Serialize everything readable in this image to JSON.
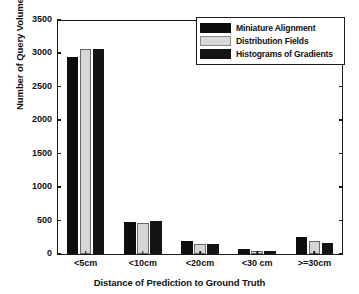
{
  "chart_data": {
    "type": "bar",
    "title": "",
    "xlabel": "Distance of Prediction to Ground Truth",
    "ylabel": "Number of Query Volumes",
    "categories": [
      "<5cm",
      "<10cm",
      "<20cm",
      "<30 cm",
      ">=30cm"
    ],
    "series": [
      {
        "name": "Miniature Alignment",
        "color": "#0d0d0d",
        "values": [
          2940,
          480,
          190,
          70,
          250
        ]
      },
      {
        "name": "Distribution Fields",
        "color": "#d6d6d6",
        "values": [
          3060,
          470,
          155,
          40,
          200
        ]
      },
      {
        "name": "Histograms of Gradients",
        "color": "#141414",
        "values": [
          3070,
          490,
          155,
          45,
          170
        ]
      }
    ],
    "ylim": [
      0,
      3500
    ],
    "yticks": [
      0,
      500,
      1000,
      1500,
      2000,
      2500,
      3000,
      3500
    ],
    "ytick_labels": [
      "0",
      "500",
      "1000",
      "1500",
      "2000",
      "2500",
      "3000",
      "3500"
    ],
    "grid": false,
    "legend_position": "upper right"
  },
  "legend": {
    "entries": [
      {
        "label": "Miniature Alignment",
        "swatch": "black-swatch"
      },
      {
        "label": "Distribution Fields",
        "swatch": "light-gray-swatch"
      },
      {
        "label": "Histograms of Gradients",
        "swatch": "dark-swatch"
      }
    ]
  }
}
